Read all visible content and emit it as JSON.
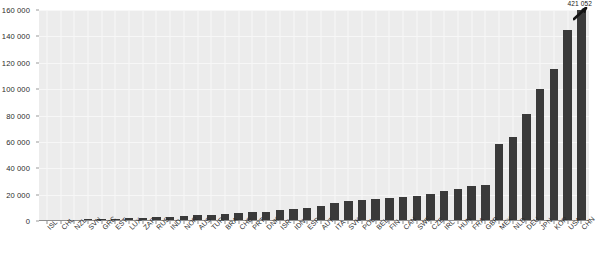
{
  "chart_data": {
    "type": "bar",
    "title": "",
    "subtitle": "",
    "xlabel": "",
    "ylabel": "",
    "grid": true,
    "legend": null,
    "ylim": [
      0,
      160000
    ],
    "yticks": [
      0,
      20000,
      40000,
      60000,
      80000,
      100000,
      120000,
      140000,
      160000
    ],
    "ytick_labels": [
      "0",
      "20 000",
      "40 000",
      "60 000",
      "80 000",
      "100 000",
      "120 000",
      "140 000",
      "160 000"
    ],
    "categories": [
      "ISL",
      "CHL",
      "NZL",
      "SVN",
      "GRC",
      "EST",
      "LUX",
      "ZAF",
      "RUS",
      "IND",
      "NOR",
      "AUS",
      "TUR",
      "BRA",
      "CHE",
      "PRT",
      "DNK",
      "ISR",
      "IDN",
      "ESP",
      "AUT",
      "ITA",
      "SVK",
      "POL",
      "BEL",
      "FIN",
      "CAN",
      "SWE",
      "CZE",
      "IRL",
      "HUN",
      "FRA",
      "GBR",
      "MEX",
      "NLD",
      "DEU",
      "JPN",
      "KOR",
      "USA",
      "CHN"
    ],
    "values": [
      300,
      600,
      900,
      1200,
      1500,
      1800,
      2100,
      2400,
      2700,
      3000,
      3600,
      4200,
      4800,
      5400,
      6000,
      6600,
      7200,
      8400,
      9000,
      10200,
      11400,
      13800,
      15000,
      16200,
      16800,
      17400,
      18000,
      18600,
      20400,
      22800,
      24000,
      26400,
      27600,
      58200,
      63600,
      81000,
      100200,
      115200,
      145200,
      421052
    ],
    "annotations": [
      {
        "series_index": 39,
        "category": "CHN",
        "label": "421 052",
        "note": "final bar is axis-truncated; diagonal break marker drawn near bar top"
      }
    ]
  },
  "axis": {
    "y_tick_labels": [
      "160 000",
      "140 000",
      "120 000",
      "100 000",
      "80 000",
      "60 000",
      "40 000",
      "20 000",
      "0"
    ]
  },
  "style": {
    "bar_color": "#3a3a3a",
    "plot_background": "#ececec",
    "gridline_color": "#f7f7f7",
    "axis_color": "#8d8d8d",
    "text_color": "#2b2b2b",
    "page_background": "#ffffff"
  }
}
